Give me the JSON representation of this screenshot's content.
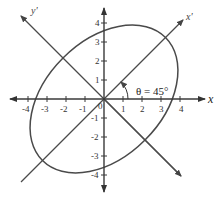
{
  "diagram": {
    "title": "",
    "axes": {
      "x_label": "x",
      "y_label": "",
      "x_prime_label": "x'",
      "y_prime_label": "y'",
      "origin_label": "0",
      "x_ticks": [
        -4,
        -3,
        -2,
        -1,
        1,
        2,
        3,
        4
      ],
      "y_ticks": [
        -4,
        -3,
        -2,
        -1,
        1,
        2,
        3,
        4
      ],
      "x_tick_labels": [
        "-4",
        "-3",
        "-2",
        "-1",
        "1",
        "2",
        "3",
        "4"
      ],
      "y_tick_labels": [
        "-4",
        "-3",
        "-2",
        "-1",
        "1",
        "2",
        "3",
        "4"
      ]
    },
    "rotation": {
      "label": "θ = 45°",
      "angle_deg": 45
    },
    "ellipse": {
      "center": [
        0,
        0
      ],
      "semi_major": 4.6,
      "semi_minor": 3.05,
      "rotation_deg": 45
    },
    "colors": {
      "axis": "#3a3a3a",
      "curve": "#4a4a4a",
      "background": "#ffffff"
    }
  }
}
